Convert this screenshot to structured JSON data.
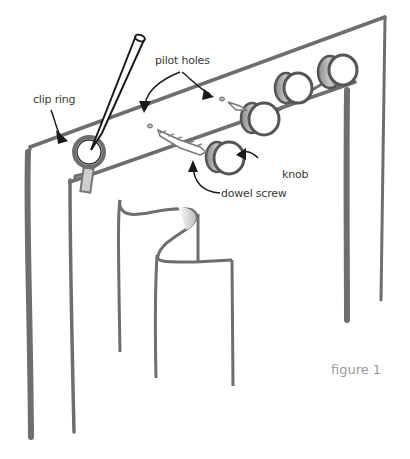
{
  "diagram": {
    "type": "illustration",
    "labels": {
      "clip_ring": "clip ring",
      "pilot_holes": "pilot holes",
      "knob": "knob",
      "dowel_screw": "dowel screw",
      "figure": "figure 1"
    },
    "colors": {
      "line": "#6e6e6e",
      "ink": "#1a1a1a",
      "fill": "#ffffff",
      "caption": "#9a9a9a"
    }
  }
}
